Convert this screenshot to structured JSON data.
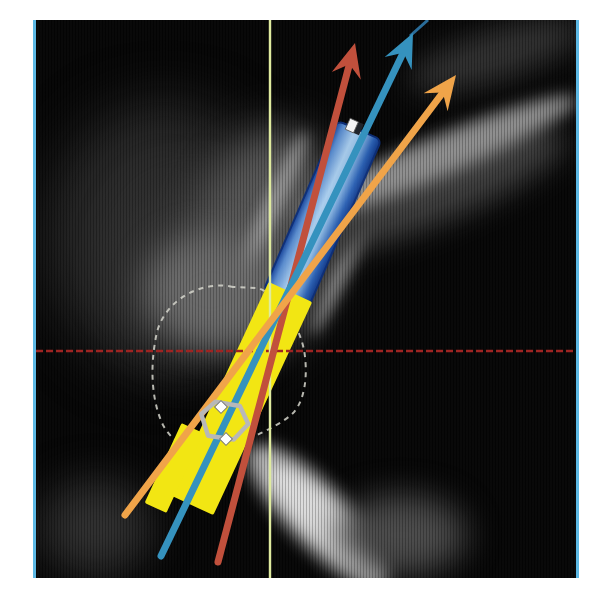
{
  "figure": {
    "kind": "sagittal-ct-cross-section-with-implant-planning-overlay",
    "background_color": "#050505",
    "frame_border_color": "#5cb8e4"
  },
  "crosshair": {
    "horizontal": {
      "name": "horizontal-crosshair-line",
      "color": "#9e2422"
    },
    "vertical": {
      "name": "vertical-crosshair-line",
      "color": "#dfeb9f"
    }
  },
  "implants": {
    "yellow": {
      "name": "yellow-planned-implant",
      "color": "#f2e613",
      "marker_ring_color": "#b8b8b8",
      "marker_dot_color": "#ffffff"
    },
    "blue": {
      "name": "blue-planned-implant",
      "gradient": [
        "#15439e",
        "#5b8fd4",
        "#aed3f4",
        "#93c0ea",
        "#2c63b8",
        "#123b8e"
      ],
      "top_marker_color": "#f4f4f4",
      "top_marker_shadow": "#20242a"
    }
  },
  "tooth_contour": {
    "name": "dashed-tooth-outline",
    "color": "#d6d6cc"
  },
  "arrows": [
    {
      "name": "red-axis-arrow",
      "color": "#c1503c"
    },
    {
      "name": "blue-axis-arrow",
      "color": "#3592be",
      "extension_color": "#2a6d9a"
    },
    {
      "name": "orange-axis-arrow",
      "color": "#f0a449"
    }
  ]
}
